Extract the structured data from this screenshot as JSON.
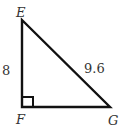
{
  "diagram": {
    "type": "right-triangle",
    "vertices": [
      {
        "name": "E",
        "x": 22,
        "y": 20
      },
      {
        "name": "F",
        "x": 22,
        "y": 107
      },
      {
        "name": "G",
        "x": 110,
        "y": 107
      }
    ],
    "right_angle_at": "F",
    "labels": {
      "E": "E",
      "F": "F",
      "G": "G",
      "side_EF": "8",
      "side_EG": "9.6"
    },
    "colors": {
      "stroke": "#111111",
      "text": "#333333",
      "background": "#ffffff"
    }
  }
}
